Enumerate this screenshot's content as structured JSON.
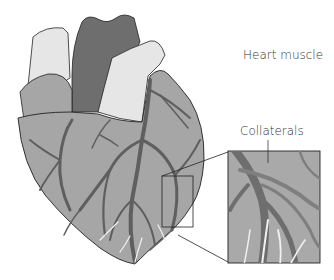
{
  "diagram": {
    "labels": {
      "heart_muscle": "Heart muscle",
      "collaterals": "Collaterals"
    },
    "colors": {
      "heart_muscle": "#a6a6a6",
      "vessels": "#7a7a7a",
      "aorta": "#6e6e6e",
      "great_vessels_light": "#e6e6e6",
      "outline": "#222222",
      "inset_bg": "#a9a9a9",
      "collateral_fill": "#8a8a8a"
    },
    "inset": {
      "description": "Magnified view of collateral vessels"
    }
  }
}
